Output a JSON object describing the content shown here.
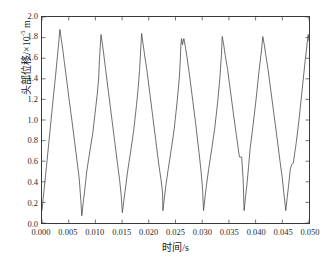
{
  "chart_data": {
    "type": "line",
    "title": "",
    "xlabel": "时间/s",
    "ylabel_prefix": "头部位移/×10",
    "ylabel_exponent": "-5",
    "ylabel_suffix": " m",
    "xlim": [
      0.0,
      0.05
    ],
    "ylim": [
      0.0,
      2.0
    ],
    "xticks": [
      0.0,
      0.005,
      0.01,
      0.015,
      0.02,
      0.025,
      0.03,
      0.035,
      0.04,
      0.045,
      0.05
    ],
    "xtick_labels": [
      "0.000",
      "0.005",
      "0.010",
      "0.015",
      "0.020",
      "0.025",
      "0.030",
      "0.035",
      "0.040",
      "0.045",
      "0.050"
    ],
    "yticks": [
      0.0,
      0.2,
      0.4,
      0.6,
      0.8,
      1.0,
      1.2,
      1.4,
      1.6,
      1.8,
      2.0
    ],
    "ytick_labels": [
      "0.0",
      "0.2",
      "0.4",
      "0.6",
      "0.8",
      "1.0",
      "1.2",
      "1.4",
      "1.6",
      "1.8",
      "2.0"
    ],
    "grid": false,
    "legend": null,
    "line_color": "#4a4a4a",
    "line_width": 0.8,
    "background_color": "#ffffff",
    "frame_color": "#3a3a3a",
    "series": [
      {
        "name": "头部位移",
        "units": "×10^-5 m",
        "period_s": 0.00745,
        "peaks": [
          {
            "x": 0.00335,
            "y": 1.88
          },
          {
            "x": 0.01105,
            "y": 1.83
          },
          {
            "x": 0.01865,
            "y": 1.84
          },
          {
            "x": 0.02615,
            "y": 1.79
          },
          {
            "x": 0.03375,
            "y": 1.81
          },
          {
            "x": 0.04135,
            "y": 1.81
          },
          {
            "x": 0.04985,
            "y": 1.83
          }
        ],
        "troughs": [
          {
            "x": 0.00745,
            "y": 0.07
          },
          {
            "x": 0.01505,
            "y": 0.1
          },
          {
            "x": 0.02265,
            "y": 0.12
          },
          {
            "x": 0.03025,
            "y": 0.12
          },
          {
            "x": 0.03785,
            "y": 0.12
          },
          {
            "x": 0.04565,
            "y": 0.12
          }
        ],
        "x": [
          0.0,
          0.00042,
          0.00084,
          0.00126,
          0.00168,
          0.00195,
          0.00224,
          0.00252,
          0.0028,
          0.00308,
          0.00335,
          0.00363,
          0.0039,
          0.00419,
          0.00447,
          0.00503,
          0.00559,
          0.00615,
          0.00671,
          0.00699,
          0.00727,
          0.00745,
          0.00772,
          0.008,
          0.00838,
          0.00894,
          0.0095,
          0.01006,
          0.01034,
          0.01062,
          0.01077,
          0.01105,
          0.01133,
          0.01161,
          0.01189,
          0.01245,
          0.01301,
          0.01357,
          0.01413,
          0.01455,
          0.01483,
          0.01505,
          0.01533,
          0.01561,
          0.01603,
          0.01659,
          0.01715,
          0.01771,
          0.01799,
          0.01827,
          0.01865,
          0.01893,
          0.01921,
          0.01963,
          0.02019,
          0.02075,
          0.02131,
          0.02187,
          0.02229,
          0.02257,
          0.02265,
          0.02293,
          0.02321,
          0.02363,
          0.02419,
          0.02475,
          0.02531,
          0.02573,
          0.02587,
          0.02601,
          0.02615,
          0.02629,
          0.02657,
          0.02685,
          0.02713,
          0.02769,
          0.02825,
          0.02881,
          0.02937,
          0.02979,
          0.03007,
          0.03025,
          0.03053,
          0.03081,
          0.03123,
          0.03179,
          0.03235,
          0.03291,
          0.03333,
          0.03361,
          0.03375,
          0.03403,
          0.03431,
          0.03473,
          0.03529,
          0.03585,
          0.03641,
          0.03697,
          0.03739,
          0.03767,
          0.03785,
          0.03813,
          0.03841,
          0.03869,
          0.03897,
          0.03953,
          0.04009,
          0.04065,
          0.04107,
          0.04135,
          0.04163,
          0.04191,
          0.04233,
          0.04289,
          0.04345,
          0.04401,
          0.04457,
          0.04499,
          0.04527,
          0.04565,
          0.04593,
          0.04621,
          0.04649,
          0.04677,
          0.04705,
          0.04761,
          0.04817,
          0.04873,
          0.04929,
          0.04985,
          0.05
        ],
        "y": [
          0.12,
          0.34,
          0.55,
          0.77,
          0.99,
          1.13,
          1.28,
          1.42,
          1.57,
          1.72,
          1.88,
          1.78,
          1.68,
          1.56,
          1.45,
          1.22,
          1.0,
          0.77,
          0.54,
          0.42,
          0.22,
          0.07,
          0.2,
          0.32,
          0.5,
          0.69,
          0.87,
          1.12,
          1.25,
          1.41,
          1.6,
          1.83,
          1.73,
          1.62,
          1.5,
          1.27,
          1.04,
          0.81,
          0.58,
          0.41,
          0.27,
          0.1,
          0.22,
          0.33,
          0.5,
          0.69,
          0.89,
          1.15,
          1.3,
          1.48,
          1.84,
          1.74,
          1.63,
          1.49,
          1.26,
          1.03,
          0.8,
          0.57,
          0.42,
          0.3,
          0.12,
          0.25,
          0.37,
          0.52,
          0.71,
          0.91,
          1.18,
          1.42,
          1.55,
          1.73,
          1.79,
          1.73,
          1.79,
          1.71,
          1.62,
          1.41,
          1.18,
          0.95,
          0.7,
          0.5,
          0.33,
          0.12,
          0.25,
          0.37,
          0.53,
          0.72,
          0.92,
          1.18,
          1.42,
          1.64,
          1.81,
          1.73,
          1.63,
          1.5,
          1.28,
          1.06,
          0.85,
          0.64,
          0.64,
          0.42,
          0.12,
          0.26,
          0.39,
          0.55,
          0.72,
          0.95,
          1.2,
          1.48,
          1.66,
          1.81,
          1.73,
          1.63,
          1.49,
          1.27,
          1.05,
          0.83,
          0.6,
          0.44,
          0.3,
          0.12,
          0.25,
          0.38,
          0.52,
          0.57,
          0.58,
          0.78,
          1.02,
          1.3,
          1.58,
          1.83,
          1.77
        ]
      }
    ]
  }
}
